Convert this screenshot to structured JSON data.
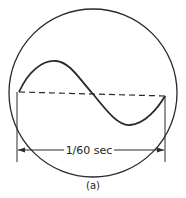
{
  "figure": {
    "dimension_label": "1/60 sec",
    "caption": "(a)",
    "colors": {
      "stroke": "#2a2a2a",
      "background": "#ffffff"
    }
  }
}
